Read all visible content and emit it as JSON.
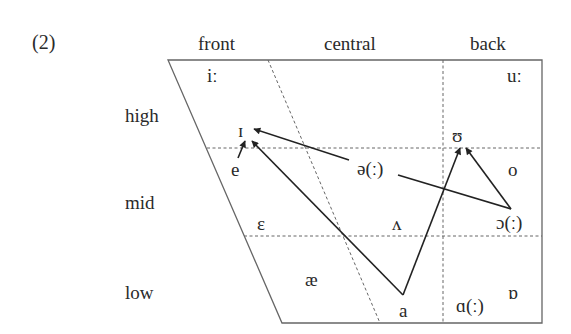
{
  "example_number": "(2)",
  "column_headers": [
    "front",
    "central",
    "back"
  ],
  "row_labels": [
    "high",
    "mid",
    "low"
  ],
  "vowels": {
    "i_long": "iː",
    "u_long": "uː",
    "small_cap_i": "ɪ",
    "upsilon": "ʊ",
    "e": "e",
    "schwa": "ə(ː)",
    "o": "o",
    "epsilon": "ɛ",
    "wedge": "ʌ",
    "open_o": "ɔ(ː)",
    "ae": "æ",
    "a": "a",
    "script_a": "ɑ(ː)",
    "turned_script_a": "ɒ"
  },
  "diagram": {
    "type": "vowel-quadrilateral",
    "line_color": "#555555",
    "arrow_color": "#222222",
    "arrows": [
      {
        "from": "e",
        "to": "ɪ"
      },
      {
        "from": "ə(ː)",
        "to": "ɪ"
      },
      {
        "from": "a",
        "to": "ɪ"
      },
      {
        "from": "a",
        "to": "ʊ"
      },
      {
        "from": "ɔ(ː)",
        "to": "ʊ"
      }
    ],
    "lines": [
      {
        "from": "ə(ː)",
        "to": "ɔ(ː)"
      }
    ]
  }
}
